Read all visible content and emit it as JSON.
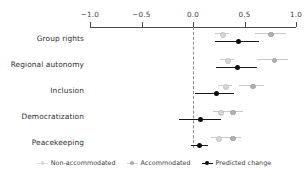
{
  "chart_data": {
    "type": "scatter",
    "title": "",
    "subtitle": "",
    "xlabel": "",
    "ylabel": "",
    "orientation": "horizontal",
    "xlim": [
      -1.0,
      1.0
    ],
    "xticks": [
      -1.0,
      -0.5,
      0.0,
      0.5,
      1.0
    ],
    "xticklabels": [
      "-1.0",
      "-0.5",
      "0.0",
      "0.5",
      "1.0"
    ],
    "grid": false,
    "zero_reference_line": 0.0,
    "legend_position": "bottom",
    "categories": [
      "Group rights",
      "Regional autonomy",
      "Inclusion",
      "Democratization",
      "Peacekeeping"
    ],
    "series": [
      {
        "name": "Non-accommodated",
        "marker": "point",
        "color": "#d6d6d6",
        "values": [
          0.28,
          0.33,
          0.31,
          0.26,
          0.24
        ],
        "ci_low": [
          0.21,
          0.26,
          0.24,
          0.19,
          0.17
        ],
        "ci_high": [
          0.35,
          0.4,
          0.38,
          0.33,
          0.31
        ]
      },
      {
        "name": "Accommodated",
        "marker": "point",
        "color": "#b0b0b0",
        "values": [
          0.75,
          0.78,
          0.57,
          0.38,
          0.38
        ],
        "ci_low": [
          0.6,
          0.62,
          0.45,
          0.28,
          0.29
        ],
        "ci_high": [
          0.9,
          0.92,
          0.69,
          0.49,
          0.47
        ]
      },
      {
        "name": "Predicted change",
        "marker": "point",
        "color": "#0c0c0c",
        "values": [
          0.44,
          0.43,
          0.23,
          0.07,
          0.06
        ],
        "ci_low": [
          0.21,
          0.22,
          0.02,
          -0.14,
          -0.02
        ],
        "ci_high": [
          0.64,
          0.62,
          0.4,
          0.27,
          0.15
        ]
      }
    ]
  },
  "axis": {
    "ticks": [
      {
        "label": "-1.0",
        "value": -1.0
      },
      {
        "label": "-0.5",
        "value": -0.5
      },
      {
        "label": "0.0",
        "value": 0.0
      },
      {
        "label": "0.5",
        "value": 0.5
      },
      {
        "label": "1.0",
        "value": 1.0
      }
    ]
  },
  "categories": [
    {
      "label": "Group rights"
    },
    {
      "label": "Regional autonomy"
    },
    {
      "label": "Inclusion"
    },
    {
      "label": "Democratization"
    },
    {
      "label": "Peacekeeping"
    }
  ],
  "legend": [
    {
      "label": "Non-accommodated",
      "color": "#d6d6d6",
      "style": "light"
    },
    {
      "label": "Accommodated",
      "color": "#b0b0b0",
      "style": "mid"
    },
    {
      "label": "Predicted change",
      "color": "#0c0c0c",
      "style": "dark"
    }
  ]
}
